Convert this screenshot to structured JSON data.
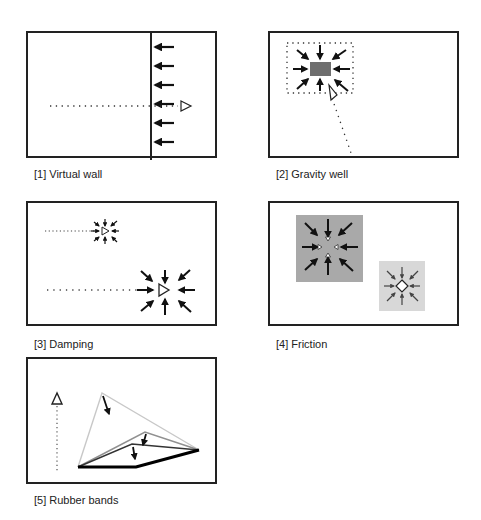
{
  "figure": {
    "panels": [
      {
        "id": 1,
        "caption": "[1] Virtual wall"
      },
      {
        "id": 2,
        "caption": "[2] Gravity well"
      },
      {
        "id": 3,
        "caption": "[3] Damping"
      },
      {
        "id": 4,
        "caption": "[4] Friction"
      },
      {
        "id": 5,
        "caption": "[5] Rubber bands"
      }
    ],
    "colors": {
      "border": "#222222",
      "arrow": "#111111",
      "well_fill": "#6e6e6e",
      "friction_high": "#a9a9a9",
      "friction_low": "#d8d8d8",
      "band_light": "#c8c8c8",
      "band_mid": "#909090"
    }
  }
}
